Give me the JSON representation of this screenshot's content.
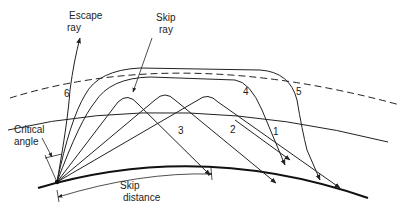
{
  "diagram": {
    "labels": {
      "escape_ray": [
        "Escape",
        "ray"
      ],
      "skip_ray": [
        "Skip",
        "ray"
      ],
      "critical_angle": [
        "Critical",
        "angle"
      ],
      "skip_distance": [
        "Skip",
        "distance"
      ]
    },
    "ray_numbers": [
      "1",
      "2",
      "3",
      "4",
      "5",
      "6"
    ],
    "colors": {
      "ink": "#222222",
      "background": "#ffffff"
    }
  }
}
